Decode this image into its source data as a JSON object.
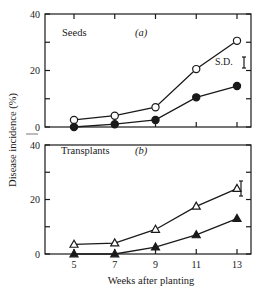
{
  "chart_data": {
    "type": "line",
    "ylabel": "Disease incidence (%)",
    "xlabel": "Weeks after planting",
    "x": [
      5,
      7,
      9,
      11,
      13
    ],
    "xticks": [
      "5",
      "7",
      "9",
      "11",
      "13"
    ],
    "panels": [
      {
        "id": "a",
        "title": "Seeds",
        "tag": "(a)",
        "ylim": [
          0,
          40
        ],
        "yticks": [
          "0",
          "20",
          "40"
        ],
        "sd_label": "S.D.",
        "series": [
          {
            "name": "open circle",
            "marker": "circle-open",
            "values": [
              2.5,
              4,
              7,
              20.5,
              30.5
            ]
          },
          {
            "name": "filled circle",
            "marker": "circle-filled",
            "values": [
              0,
              1,
              2.5,
              10.5,
              14.5
            ]
          }
        ]
      },
      {
        "id": "b",
        "title": "Transplants",
        "tag": "(b)",
        "ylim": [
          0,
          40
        ],
        "yticks": [
          "0",
          "20",
          "40"
        ],
        "sd_label": "",
        "series": [
          {
            "name": "open triangle",
            "marker": "triangle-open",
            "values": [
              3.5,
              4,
              9,
              17.5,
              24
            ]
          },
          {
            "name": "filled triangle",
            "marker": "triangle-filled",
            "values": [
              0,
              0,
              2.5,
              7,
              13
            ]
          }
        ]
      }
    ]
  }
}
